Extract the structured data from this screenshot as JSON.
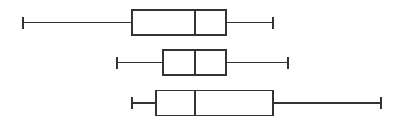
{
  "chart_data": {
    "type": "boxplot",
    "title": "",
    "xlabel": "",
    "ylabel": "",
    "orientation": "horizontal",
    "axes_visible": false,
    "grid": false,
    "legend": null,
    "xlim": [
      0,
      399
    ],
    "units_note": "values in pixel scale (no axis shown)",
    "series": [
      {
        "name": "box-1",
        "whisker_low": 23,
        "q1": 132,
        "median": 195,
        "q3": 226,
        "whisker_high": 273
      },
      {
        "name": "box-2",
        "whisker_low": 117,
        "q1": 163,
        "median": 195,
        "q3": 226,
        "whisker_high": 288
      },
      {
        "name": "box-3",
        "whisker_low": 132,
        "q1": 156,
        "median": 195,
        "q3": 273,
        "whisker_high": 381
      }
    ]
  },
  "style": {
    "stroke": "#333333",
    "fill": "#ffffff",
    "background": "#ffffff"
  }
}
